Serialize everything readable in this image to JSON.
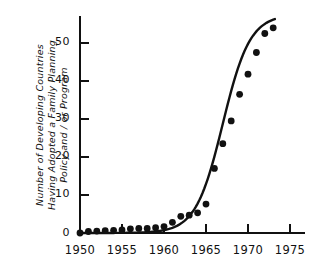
{
  "chart_data": {
    "type": "scatter",
    "title": "",
    "xlabel": "",
    "ylabel": "Number of Developing Countries Having Adopted a Family Planning Policy and / or Program",
    "ylabel_lines": [
      "Number of Developing Countries",
      "Having Adopted a Family Planning",
      "Policy and / or Program"
    ],
    "xlim": [
      1950,
      1975
    ],
    "ylim": [
      0,
      57
    ],
    "xticks": [
      1950,
      1955,
      1960,
      1965,
      1970,
      1975
    ],
    "yticks": [
      0,
      10,
      20,
      30,
      40,
      50
    ],
    "xtick_labels": [
      "1950",
      "1955",
      "1960",
      "1965",
      "1970",
      "1975"
    ],
    "ytick_labels": [
      "0",
      "10",
      "20",
      "30",
      "40",
      "50"
    ],
    "grid": false,
    "legend": null,
    "marker": "filled-circle",
    "marker_color": "#111111",
    "line_color": "#111111",
    "x": [
      1950,
      1951,
      1952,
      1953,
      1954,
      1955,
      1956,
      1957,
      1958,
      1959,
      1960,
      1961,
      1962,
      1963,
      1964,
      1965,
      1966,
      1967,
      1968,
      1969,
      1970,
      1971,
      1972,
      1973
    ],
    "values": [
      0,
      0.4,
      0.5,
      0.6,
      0.7,
      0.8,
      1.1,
      1.2,
      1.2,
      1.4,
      1.7,
      2.8,
      4.4,
      4.7,
      5.3,
      7.6,
      17,
      23.5,
      29.5,
      36.5,
      41.8,
      47.5,
      52.5,
      54
    ],
    "fit_curve": "logistic S-curve through data points",
    "series": [
      {
        "name": "Developing countries with family planning policy/program",
        "values": [
          0,
          0.4,
          0.5,
          0.6,
          0.7,
          0.8,
          1.1,
          1.2,
          1.2,
          1.4,
          1.7,
          2.8,
          4.4,
          4.7,
          5.3,
          7.6,
          17,
          23.5,
          29.5,
          36.5,
          41.8,
          47.5,
          52.5,
          54
        ]
      }
    ]
  },
  "axes": {
    "axis_color": "#111111"
  }
}
